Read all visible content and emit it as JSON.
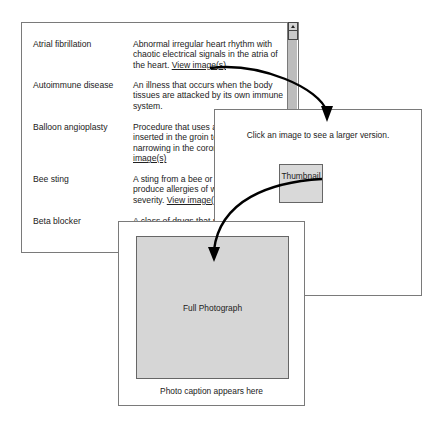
{
  "glossary": {
    "entries": [
      {
        "term": "Atrial fibrillation",
        "definition": "Abnormal irregular heart rhythm with chaotic electrical signals in the atria of the heart.",
        "link": "View image(s)"
      },
      {
        "term": "Autoimmune disease",
        "definition": "An illness that occurs when the body tissues are attacked by its own immune system.",
        "link": ""
      },
      {
        "term": "Balloon angioplasty",
        "definition": "Procedure that uses a balloon catheter inserted in the groin to enlarge a narrowing in the coronary artery.",
        "link": "View image(s)"
      },
      {
        "term": "Bee sting",
        "definition": "A sting from a bee or wasp that can produce allergies of widely varying severity.",
        "link": "View image(s)"
      },
      {
        "term": "Beta blocker",
        "definition": "A class of drugs that relieve",
        "link": ""
      }
    ]
  },
  "thumbnail_panel": {
    "instruction": "Click an image to see a larger version.",
    "thumbnail_label": "Thumbnail"
  },
  "photo_panel": {
    "photo_label": "Full Photograph",
    "caption": "Photo caption appears here"
  },
  "colors": {
    "border": "#7a7a7a",
    "image_fill": "#d6d6d6",
    "scrollbar": "#bdbdbd",
    "arrow": "#000000"
  }
}
